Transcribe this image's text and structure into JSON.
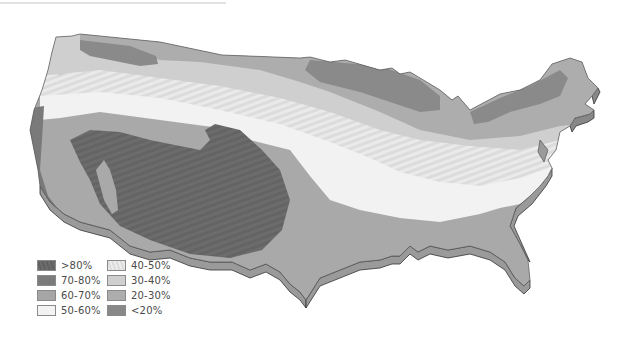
{
  "map": {
    "title": "",
    "region": "Contiguous United States",
    "style": "3D extruded grayscale choropleth"
  },
  "legend": {
    "items": [
      {
        "label": ">80%",
        "color": "#6a6a6a",
        "pattern": "hatched"
      },
      {
        "label": "70-80%",
        "color": "#7b7b7b"
      },
      {
        "label": "60-70%",
        "color": "#a6a6a6"
      },
      {
        "label": "50-60%",
        "color": "#f1f1f1"
      },
      {
        "label": "40-50%",
        "color": "#e4e4e4",
        "pattern": "hatched"
      },
      {
        "label": "30-40%",
        "color": "#cfcfcf"
      },
      {
        "label": "20-30%",
        "color": "#adadad"
      },
      {
        "label": "<20%",
        "color": "#888888"
      }
    ]
  }
}
